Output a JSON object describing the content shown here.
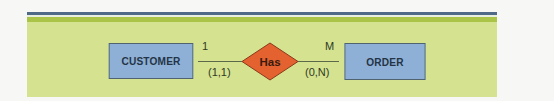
{
  "diagram": {
    "type": "entity-relationship",
    "colors": {
      "panel_topbar": "#4f6a86",
      "panel_stripe": "#a9c447",
      "panel_body": "#d5e28f",
      "entity_fill": "#8fb0d6",
      "relationship_fill": "#e4622f"
    },
    "entities": [
      {
        "id": "customer",
        "label": "CUSTOMER"
      },
      {
        "id": "order",
        "label": "ORDER"
      }
    ],
    "relationship": {
      "label": "Has",
      "shape": "diamond",
      "left": {
        "entity": "customer",
        "cardinality": "1",
        "participation": "(1,1)"
      },
      "right": {
        "entity": "order",
        "cardinality": "M",
        "participation": "(0,N)"
      }
    }
  }
}
